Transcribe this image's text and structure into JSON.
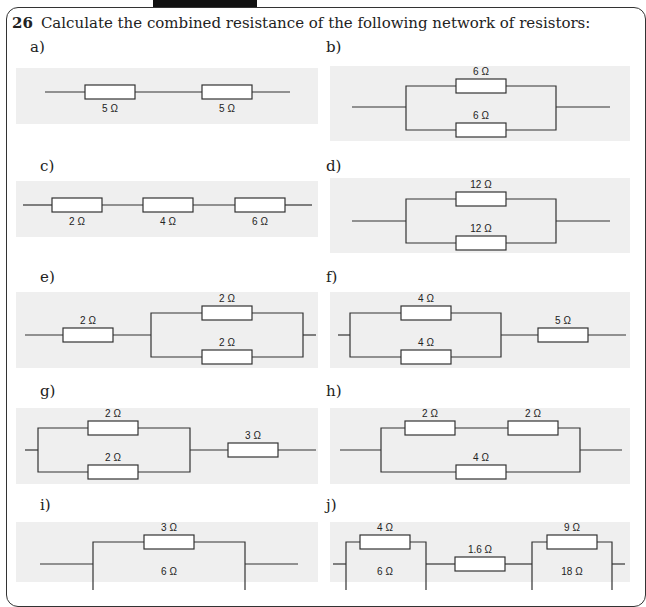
{
  "question": {
    "number": "26",
    "text": "Calculate the combined resistance of the following network of resistors:"
  },
  "parts": [
    {
      "label": "a)",
      "type": "series",
      "resistors": [
        "5 Ω",
        "5 Ω"
      ]
    },
    {
      "label": "b)",
      "type": "parallel",
      "resistors": [
        "6 Ω",
        "6 Ω"
      ]
    },
    {
      "label": "c)",
      "type": "series",
      "resistors": [
        "2 Ω",
        "4 Ω",
        "6 Ω"
      ]
    },
    {
      "label": "d)",
      "type": "parallel",
      "resistors": [
        "12 Ω",
        "12 Ω"
      ]
    },
    {
      "label": "e)",
      "type": "series-then-parallel",
      "resistors": [
        "2 Ω",
        "2 Ω",
        "2 Ω"
      ]
    },
    {
      "label": "f)",
      "type": "parallel-then-series",
      "resistors": [
        "4 Ω",
        "4 Ω",
        "5 Ω"
      ]
    },
    {
      "label": "g)",
      "type": "parallel-then-series",
      "resistors": [
        "2 Ω",
        "2 Ω",
        "3 Ω"
      ]
    },
    {
      "label": "h)",
      "type": "series-branch-parallel",
      "resistors": [
        "2 Ω",
        "2 Ω",
        "4 Ω"
      ]
    },
    {
      "label": "i)",
      "type": "parallel",
      "resistors": [
        "3 Ω",
        "6 Ω"
      ]
    },
    {
      "label": "j)",
      "type": "parallel-series-parallel",
      "resistors": [
        "4 Ω",
        "6 Ω",
        "1.6 Ω",
        "9 Ω",
        "18 Ω"
      ]
    }
  ]
}
